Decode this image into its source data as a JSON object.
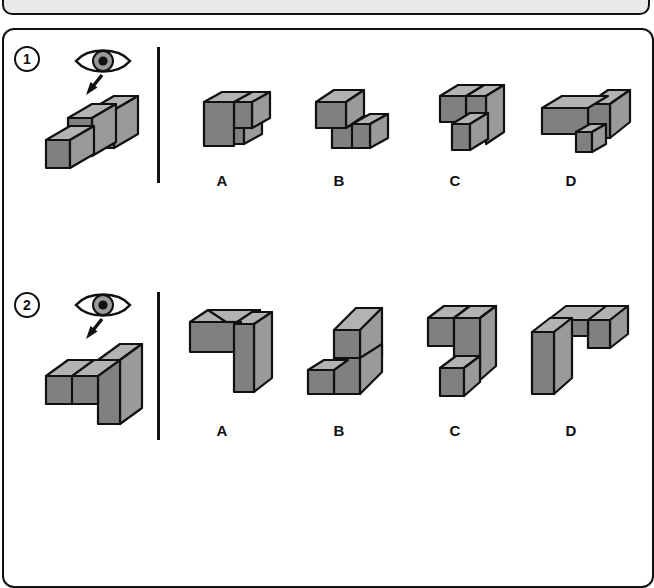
{
  "page": {
    "type": "spatial-reasoning-worksheet",
    "background_color": "#ffffff",
    "panel_border_color": "#111111",
    "top_bar_color": "#e9e9e9"
  },
  "colors": {
    "cube_front": "#808080",
    "cube_top": "#b3b3b3",
    "cube_side": "#9a9a9a",
    "outline": "#111111",
    "text": "#111111"
  },
  "icons": {
    "eye": "eye-icon",
    "arrow": "arrow-down-left-icon"
  },
  "questions": [
    {
      "number": "1",
      "prompt_icon": "eye-icon",
      "reference_label": "reference-solid-1",
      "options": [
        {
          "letter": "A",
          "name": "option-a-solid"
        },
        {
          "letter": "B",
          "name": "option-b-solid"
        },
        {
          "letter": "C",
          "name": "option-c-solid"
        },
        {
          "letter": "D",
          "name": "option-d-solid"
        }
      ]
    },
    {
      "number": "2",
      "prompt_icon": "eye-icon",
      "reference_label": "reference-solid-2",
      "options": [
        {
          "letter": "A",
          "name": "option-a-solid"
        },
        {
          "letter": "B",
          "name": "option-b-solid"
        },
        {
          "letter": "C",
          "name": "option-c-solid"
        },
        {
          "letter": "D",
          "name": "option-d-solid"
        }
      ]
    }
  ]
}
